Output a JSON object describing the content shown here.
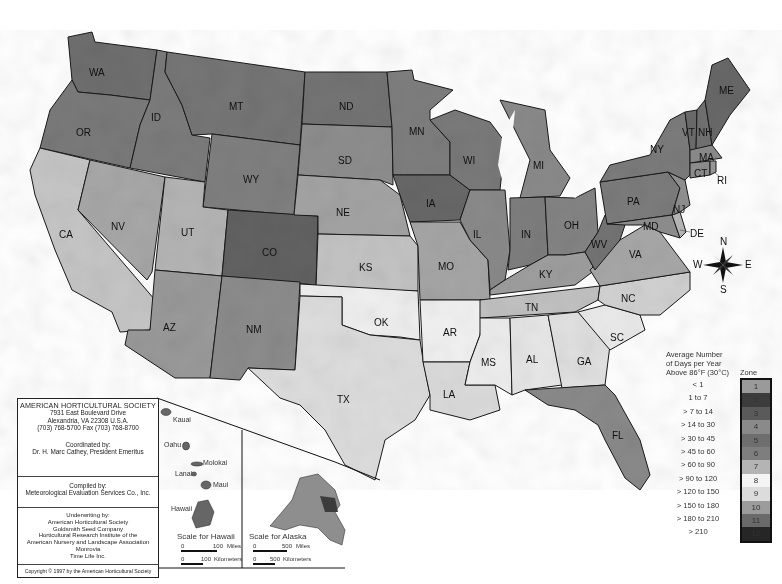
{
  "map": {
    "title": "AHS Plant Heat Zone Map",
    "states": [
      {
        "abbr": "WA",
        "x": 96,
        "y": 72
      },
      {
        "abbr": "OR",
        "x": 83,
        "y": 132
      },
      {
        "abbr": "CA",
        "x": 66,
        "y": 234
      },
      {
        "abbr": "ID",
        "x": 158,
        "y": 117
      },
      {
        "abbr": "NV",
        "x": 118,
        "y": 226
      },
      {
        "abbr": "MT",
        "x": 236,
        "y": 106
      },
      {
        "abbr": "WY",
        "x": 250,
        "y": 179
      },
      {
        "abbr": "UT",
        "x": 188,
        "y": 232
      },
      {
        "abbr": "CO",
        "x": 269,
        "y": 252
      },
      {
        "abbr": "AZ",
        "x": 170,
        "y": 327
      },
      {
        "abbr": "NM",
        "x": 253,
        "y": 329
      },
      {
        "abbr": "ND",
        "x": 346,
        "y": 106
      },
      {
        "abbr": "SD",
        "x": 345,
        "y": 160
      },
      {
        "abbr": "NE",
        "x": 343,
        "y": 212
      },
      {
        "abbr": "KS",
        "x": 366,
        "y": 267
      },
      {
        "abbr": "OK",
        "x": 381,
        "y": 322
      },
      {
        "abbr": "TX",
        "x": 344,
        "y": 399
      },
      {
        "abbr": "MN",
        "x": 416,
        "y": 131
      },
      {
        "abbr": "IA",
        "x": 433,
        "y": 203
      },
      {
        "abbr": "MO",
        "x": 445,
        "y": 266
      },
      {
        "abbr": "AR",
        "x": 450,
        "y": 332
      },
      {
        "abbr": "LA",
        "x": 450,
        "y": 394
      },
      {
        "abbr": "WI",
        "x": 470,
        "y": 160
      },
      {
        "abbr": "IL",
        "x": 480,
        "y": 234
      },
      {
        "abbr": "MI",
        "x": 540,
        "y": 165
      },
      {
        "abbr": "IN",
        "x": 528,
        "y": 234
      },
      {
        "abbr": "OH",
        "x": 571,
        "y": 225
      },
      {
        "abbr": "KY",
        "x": 546,
        "y": 274
      },
      {
        "abbr": "TN",
        "x": 532,
        "y": 307
      },
      {
        "abbr": "MS",
        "x": 488,
        "y": 362
      },
      {
        "abbr": "AL",
        "x": 533,
        "y": 359
      },
      {
        "abbr": "GA",
        "x": 584,
        "y": 361
      },
      {
        "abbr": "FL",
        "x": 619,
        "y": 435
      },
      {
        "abbr": "SC",
        "x": 617,
        "y": 337
      },
      {
        "abbr": "NC",
        "x": 628,
        "y": 298
      },
      {
        "abbr": "VA",
        "x": 636,
        "y": 254
      },
      {
        "abbr": "WV",
        "x": 598,
        "y": 244
      },
      {
        "abbr": "PA",
        "x": 634,
        "y": 201
      },
      {
        "abbr": "NY",
        "x": 657,
        "y": 149
      },
      {
        "abbr": "ME",
        "x": 726,
        "y": 90
      },
      {
        "abbr": "VT",
        "x": 689,
        "y": 132
      },
      {
        "abbr": "NH",
        "x": 705,
        "y": 132
      },
      {
        "abbr": "MA",
        "x": 706,
        "y": 157
      },
      {
        "abbr": "CT",
        "x": 701,
        "y": 173
      },
      {
        "abbr": "RI",
        "x": 724,
        "y": 180
      },
      {
        "abbr": "NJ",
        "x": 680,
        "y": 209
      },
      {
        "abbr": "DE",
        "x": 697,
        "y": 233
      },
      {
        "abbr": "MD",
        "x": 650,
        "y": 226
      }
    ]
  },
  "compass": {
    "n": "N",
    "s": "S",
    "e": "E",
    "w": "W"
  },
  "info": {
    "org": "AMERICAN HORTICULTURAL SOCIETY",
    "address1": "7931 East Boulevard Drive",
    "address2": "Alexandria, VA 22308 U.S.A.",
    "phone": "(703) 768-5700 Fax (703) 768-8700",
    "coordinated_label": "Coordinated by:",
    "coordinated_by": "Dr. H. Marc Cathey, President Emeritus",
    "compiled_label": "Compiled by:",
    "compiled_by": "Meteorological Evaluation Services Co., Inc.",
    "underwriting_label": "Underwriting by:",
    "underwriters": [
      "American Horticultural Society",
      "Goldsmith Seed Company",
      "Horticultural Research Institute of the",
      "American Nursery and Landscape Association",
      "Monrovia",
      "Time Life Inc."
    ],
    "copyright": "Copyright © 1997 by the American Horticultural Society"
  },
  "hawaii": {
    "islands": [
      "Kauai",
      "Oahu",
      "Molokai",
      "Lanai",
      "Maui",
      "Hawaii"
    ],
    "scale_title": "Scale for Hawaii",
    "miles_zero": "0",
    "miles_val": "100",
    "miles_unit": "Miles",
    "km_zero": "0",
    "km_val": "100",
    "km_unit": "Kilometers"
  },
  "alaska": {
    "scale_title": "Scale for Alaska",
    "miles_zero": "0",
    "miles_val": "500",
    "miles_unit": "Miles",
    "km_zero": "0",
    "km_val": "500",
    "km_unit": "Kilometers"
  },
  "legend": {
    "heading1": "Average Number",
    "heading2": "of Days per Year",
    "heading3": "Above 86°F (30°C)",
    "zone_label": "Zone",
    "zones": [
      {
        "zone": "1",
        "range": "< 1",
        "color": "#9a9a9a"
      },
      {
        "zone": "2",
        "range": "1 to 7",
        "color": "#3c3c3c"
      },
      {
        "zone": "3",
        "range": "> 7 to 14",
        "color": "#5a5a5a"
      },
      {
        "zone": "4",
        "range": "> 14 to 30",
        "color": "#8a8a8a"
      },
      {
        "zone": "5",
        "range": "> 30 to 45",
        "color": "#6e6e6e"
      },
      {
        "zone": "6",
        "range": "> 45 to 60",
        "color": "#7e7e7e"
      },
      {
        "zone": "7",
        "range": "> 60 to 90",
        "color": "#b4b4b4"
      },
      {
        "zone": "8",
        "range": "> 90 to 120",
        "color": "#f4f4f4"
      },
      {
        "zone": "9",
        "range": "> 120 to 150",
        "color": "#dcdcdc"
      },
      {
        "zone": "10",
        "range": "> 150 to 180",
        "color": "#9c9c9c"
      },
      {
        "zone": "11",
        "range": "> 180 to 210",
        "color": "#6a6a6a"
      },
      {
        "zone": "12",
        "range": "> 210",
        "color": "#262626"
      }
    ]
  }
}
